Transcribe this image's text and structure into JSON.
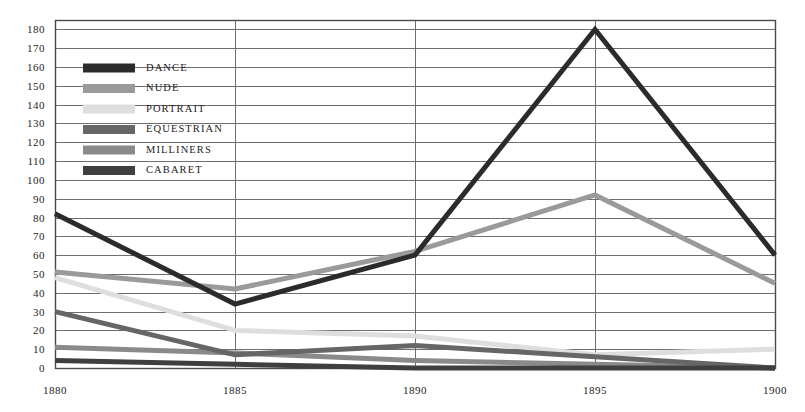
{
  "chart_data": {
    "type": "line",
    "title": "",
    "subtitle": "",
    "xlabel": "",
    "ylabel": "",
    "x": [
      1880,
      1885,
      1890,
      1895,
      1900
    ],
    "categories": [
      "1880",
      "1885",
      "1890",
      "1895",
      "1900"
    ],
    "xlim": [
      1880,
      1900
    ],
    "ylim": [
      0,
      185
    ],
    "ytick_values": [
      0,
      10,
      20,
      30,
      40,
      50,
      60,
      70,
      80,
      90,
      100,
      110,
      120,
      130,
      140,
      150,
      160,
      170,
      180
    ],
    "ytick_labels": [
      "0",
      "10",
      "20",
      "30",
      "40",
      "50",
      "60",
      "70",
      "80",
      "90",
      "100",
      "110",
      "120",
      "130",
      "140",
      "150",
      "160",
      "170",
      "180"
    ],
    "grid": true,
    "grid_horizontal": true,
    "grid_vertical": true,
    "legend_position": "upper-left-inside",
    "series": [
      {
        "name": "DANCE",
        "color": "#2b2b2b",
        "values": [
          82,
          34,
          60,
          180,
          60
        ]
      },
      {
        "name": "NUDE",
        "color": "#9a9a9a",
        "values": [
          51,
          42,
          62,
          92,
          45
        ]
      },
      {
        "name": "PORTRAIT",
        "color": "#dedede",
        "values": [
          48,
          20,
          17,
          7,
          10
        ]
      },
      {
        "name": "EQUESTRIAN",
        "color": "#666666",
        "values": [
          30,
          7,
          12,
          6,
          0
        ]
      },
      {
        "name": "MILLINERS",
        "color": "#8a8a8a",
        "values": [
          11,
          8,
          4,
          2,
          0
        ]
      },
      {
        "name": "CABARET",
        "color": "#3f3f3f",
        "values": [
          4,
          2,
          0,
          0,
          0
        ]
      }
    ]
  },
  "legend": {
    "items": [
      {
        "label": "DANCE",
        "swatch_color": "#2b2b2b"
      },
      {
        "label": "NUDE",
        "swatch_color": "#9a9a9a"
      },
      {
        "label": "PORTRAIT",
        "swatch_color": "#dedede"
      },
      {
        "label": "EQUESTRIAN",
        "swatch_color": "#666666"
      },
      {
        "label": "MILLINERS",
        "swatch_color": "#8a8a8a"
      },
      {
        "label": "CABARET",
        "swatch_color": "#3f3f3f"
      }
    ]
  },
  "style": {
    "axis_color": "#4a4a4a",
    "grid_color": "#6e6e6e",
    "text_color": "#1c1c1c",
    "background": "#ffffff",
    "line_width": 5
  }
}
